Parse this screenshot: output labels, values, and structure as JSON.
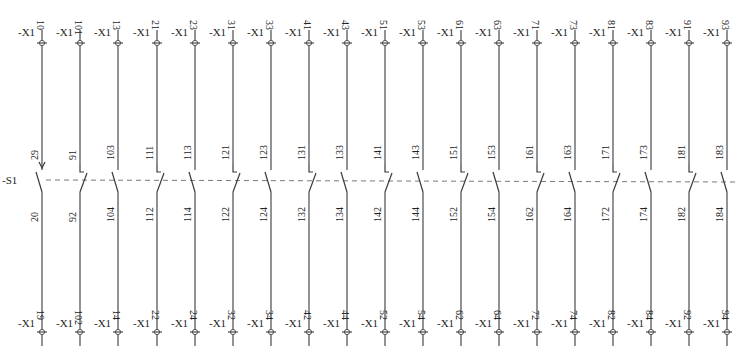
{
  "diagram": {
    "device_label": "-S1",
    "terminal_prefix": "-X1",
    "colors": {
      "line": "#4a4a4a",
      "dash": "#7a7a7a",
      "text": "#222222",
      "background": "#ffffff"
    },
    "contacts": [
      {
        "x": 42,
        "type": "NO-actuator",
        "top_terminal": "10",
        "top_pin": "29",
        "bottom_pin": "20",
        "bottom_terminal": "19"
      },
      {
        "x": 80,
        "type": "NC",
        "top_terminal": "101",
        "top_pin": "91",
        "bottom_pin": "92",
        "bottom_terminal": "102"
      },
      {
        "x": 118,
        "type": "NO",
        "top_terminal": "13",
        "top_pin": "103",
        "bottom_pin": "104",
        "bottom_terminal": "14"
      },
      {
        "x": 157,
        "type": "NC",
        "top_terminal": "21",
        "top_pin": "111",
        "bottom_pin": "112",
        "bottom_terminal": "22"
      },
      {
        "x": 195,
        "type": "NO",
        "top_terminal": "23",
        "top_pin": "113",
        "bottom_pin": "114",
        "bottom_terminal": "24"
      },
      {
        "x": 233,
        "type": "NC",
        "top_terminal": "31",
        "top_pin": "121",
        "bottom_pin": "122",
        "bottom_terminal": "32"
      },
      {
        "x": 271,
        "type": "NO",
        "top_terminal": "33",
        "top_pin": "123",
        "bottom_pin": "124",
        "bottom_terminal": "34"
      },
      {
        "x": 309,
        "type": "NC",
        "top_terminal": "41",
        "top_pin": "131",
        "bottom_pin": "132",
        "bottom_terminal": "42"
      },
      {
        "x": 347,
        "type": "NO",
        "top_terminal": "43",
        "top_pin": "133",
        "bottom_pin": "134",
        "bottom_terminal": "44"
      },
      {
        "x": 385,
        "type": "NC",
        "top_terminal": "51",
        "top_pin": "141",
        "bottom_pin": "142",
        "bottom_terminal": "52"
      },
      {
        "x": 423,
        "type": "NO",
        "top_terminal": "53",
        "top_pin": "143",
        "bottom_pin": "144",
        "bottom_terminal": "54"
      },
      {
        "x": 461,
        "type": "NC",
        "top_terminal": "61",
        "top_pin": "151",
        "bottom_pin": "152",
        "bottom_terminal": "62"
      },
      {
        "x": 499,
        "type": "NO",
        "top_terminal": "63",
        "top_pin": "153",
        "bottom_pin": "154",
        "bottom_terminal": "64"
      },
      {
        "x": 537,
        "type": "NC",
        "top_terminal": "71",
        "top_pin": "161",
        "bottom_pin": "162",
        "bottom_terminal": "72"
      },
      {
        "x": 575,
        "type": "NO",
        "top_terminal": "73",
        "top_pin": "163",
        "bottom_pin": "164",
        "bottom_terminal": "74"
      },
      {
        "x": 613,
        "type": "NC",
        "top_terminal": "81",
        "top_pin": "171",
        "bottom_pin": "172",
        "bottom_terminal": "82"
      },
      {
        "x": 651,
        "type": "NO",
        "top_terminal": "83",
        "top_pin": "173",
        "bottom_pin": "174",
        "bottom_terminal": "84"
      },
      {
        "x": 689,
        "type": "NC",
        "top_terminal": "91",
        "top_pin": "181",
        "bottom_pin": "182",
        "bottom_terminal": "92"
      },
      {
        "x": 727,
        "type": "NO",
        "top_terminal": "93",
        "top_pin": "183",
        "bottom_pin": "184",
        "bottom_terminal": "94"
      }
    ]
  }
}
